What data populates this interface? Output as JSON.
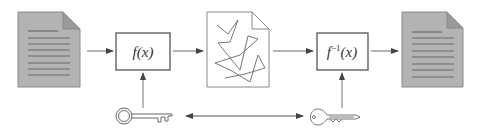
{
  "diagram": {
    "nodes": [
      {
        "id": "plaintext",
        "kind": "document",
        "style": "filled"
      },
      {
        "id": "encrypt",
        "kind": "function-box",
        "label": "f(x)"
      },
      {
        "id": "ciphertext",
        "kind": "document",
        "style": "scrambled"
      },
      {
        "id": "decrypt",
        "kind": "function-box",
        "label_base": "f",
        "label_sup": "−1",
        "label_arg": "(x)"
      },
      {
        "id": "recovered",
        "kind": "document",
        "style": "filled"
      }
    ],
    "keys": [
      {
        "id": "encryption-key",
        "icon": "key-skeleton-icon",
        "feeds": "encrypt"
      },
      {
        "id": "decryption-key",
        "icon": "key-modern-icon",
        "feeds": "decrypt"
      }
    ],
    "edges": [
      {
        "from": "plaintext",
        "to": "encrypt"
      },
      {
        "from": "encrypt",
        "to": "ciphertext"
      },
      {
        "from": "ciphertext",
        "to": "decrypt"
      },
      {
        "from": "decrypt",
        "to": "recovered"
      },
      {
        "from": "encryption-key",
        "to": "encrypt"
      },
      {
        "from": "decryption-key",
        "to": "decrypt"
      },
      {
        "from": "encryption-key",
        "to": "decryption-key",
        "bidirectional": true
      }
    ],
    "colors": {
      "doc_fill": "#b3b3b3",
      "doc_stroke": "#8a8a8a",
      "doc_lines": "#6e6e6e",
      "box_stroke": "#555555",
      "arrow": "#555555",
      "scramble": "#777777"
    }
  }
}
